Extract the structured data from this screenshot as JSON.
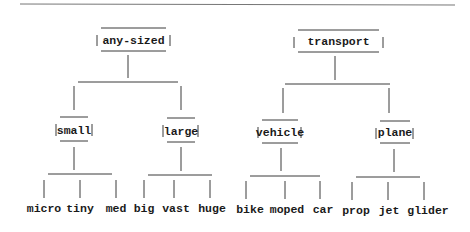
{
  "diagram": {
    "type": "tree",
    "trees": [
      {
        "root": "any-sized",
        "children": [
          {
            "label": "small",
            "leaves": [
              "micro",
              "tiny",
              "med"
            ]
          },
          {
            "label": "large",
            "leaves": [
              "big",
              "vast",
              "huge"
            ]
          }
        ]
      },
      {
        "root": "transport",
        "children": [
          {
            "label": "vehicle",
            "leaves": [
              "bike",
              "moped",
              "car"
            ]
          },
          {
            "label": "plane",
            "leaves": [
              "prop",
              "jet",
              "glider"
            ]
          }
        ]
      }
    ]
  },
  "colors": {
    "line": "#3a3a3a",
    "text": "#1a1a1a",
    "rule": "#777777",
    "background": "#ffffff"
  }
}
